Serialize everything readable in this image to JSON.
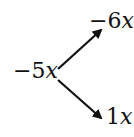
{
  "diagram": {
    "root": {
      "coef": "−5",
      "var": "x"
    },
    "branches": [
      {
        "coef": "−6",
        "var": "x",
        "direction": "up-right"
      },
      {
        "coef": "1",
        "var": "x",
        "direction": "down-right"
      }
    ],
    "colors": {
      "ink": "#111111",
      "background": "#ffffff"
    }
  }
}
